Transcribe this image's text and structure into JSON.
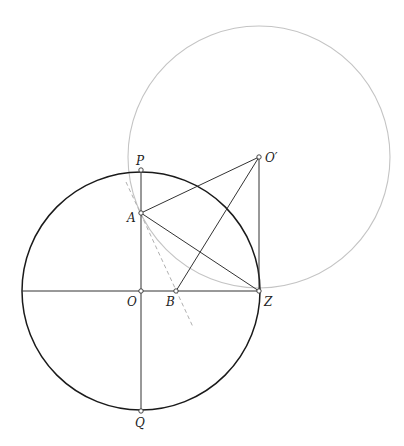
{
  "diagram": {
    "type": "geometric-construction",
    "colors": {
      "main_circle": "#1a1a1a",
      "aux_circle": "#c4c4c4",
      "segments": "#333333",
      "tangent_dashed": "#b0b0b0",
      "background": "#ffffff"
    },
    "circles": [
      {
        "name": "main-circle",
        "center": "O",
        "cx": 141,
        "cy": 291,
        "r": 119
      },
      {
        "name": "auxiliary-circle",
        "center": "O'",
        "cx": 259,
        "cy": 157,
        "r": 131
      }
    ],
    "points": {
      "P": {
        "label": "P",
        "x": 141,
        "y": 170
      },
      "A": {
        "label": "A",
        "x": 141,
        "y": 213
      },
      "O": {
        "label": "O",
        "x": 141,
        "y": 291
      },
      "B": {
        "label": "B",
        "x": 176,
        "y": 291
      },
      "Z": {
        "label": "Z",
        "x": 259,
        "y": 291
      },
      "Q": {
        "label": "Q",
        "x": 141,
        "y": 411
      },
      "O_prime": {
        "label": "O′",
        "x": 259,
        "y": 157
      }
    },
    "segments": [
      [
        "P",
        "Q"
      ],
      [
        "A",
        "O_prime"
      ],
      [
        "A",
        "Z"
      ],
      [
        "B",
        "O_prime"
      ],
      [
        "O_prime",
        "Z"
      ]
    ],
    "diameter_horizontal": {
      "x1": 22,
      "x2": 259,
      "y": 291
    },
    "dashed_line": {
      "x1": 126,
      "y1": 182,
      "x2": 193,
      "y2": 327
    }
  }
}
